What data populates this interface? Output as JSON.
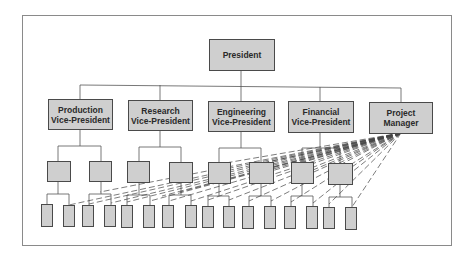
{
  "diagram": {
    "type": "organization-chart (matrix / project organization)",
    "top": {
      "label": "President"
    },
    "vice_presidents": [
      {
        "line1": "Production",
        "line2": "Vice-President"
      },
      {
        "line1": "Research",
        "line2": "Vice-President"
      },
      {
        "line1": "Engineering",
        "line2": "Vice-President"
      },
      {
        "line1": "Financial",
        "line2": "Vice-President"
      },
      {
        "line1": "Project",
        "line2": "Manager"
      }
    ],
    "structure": {
      "level3_units_per_vp": 2,
      "level4_units_per_level3": 2,
      "dashed_links_from": "Project Manager",
      "dashed_links_to": "multiple level-3 and level-4 units"
    },
    "colors": {
      "box_fill": "#cfcfcf",
      "box_border": "#4a4a4a",
      "line": "#555555",
      "frame": "#8a8a8a"
    }
  }
}
